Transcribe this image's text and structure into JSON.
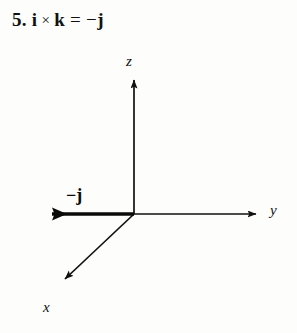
{
  "problem": {
    "number": "5.",
    "equation": {
      "left_vector_1": "i",
      "operator": "×",
      "left_vector_2": "k",
      "equals": "=",
      "result_sign": "−",
      "result_vector": "j"
    }
  },
  "figure": {
    "type": "3d-axes-vector-diagram",
    "background_color": "#fdfdfc",
    "ink_color": "#111111",
    "axes": [
      {
        "name": "z",
        "label": "z",
        "direction": "up"
      },
      {
        "name": "y",
        "label": "y",
        "direction": "right"
      },
      {
        "name": "x",
        "label": "x",
        "direction": "down-left"
      }
    ],
    "vectors": [
      {
        "name": "minus-j",
        "label": "−j",
        "direction": "left",
        "along_axis": "negative-y",
        "style": "thick-solid-arrow"
      }
    ],
    "origin": {
      "x": 134,
      "y": 214
    }
  }
}
